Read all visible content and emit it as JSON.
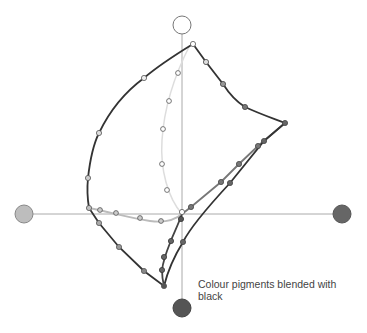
{
  "diagram": {
    "caption": "Colour pigments blended with black",
    "axes": {
      "vertical": {
        "x": 182,
        "y1": 25,
        "y2": 308
      },
      "horizontal": {
        "y": 214,
        "x1": 24,
        "x2": 342
      }
    },
    "anchors": [
      {
        "name": "top",
        "cx": 182,
        "cy": 25,
        "r": 9,
        "fill": "#ffffff"
      },
      {
        "name": "left",
        "cx": 24,
        "cy": 214,
        "r": 9,
        "fill": "#bdbdbd"
      },
      {
        "name": "right",
        "cx": 342,
        "cy": 214,
        "r": 9,
        "fill": "#666666"
      },
      {
        "name": "bottom",
        "cx": 182,
        "cy": 308,
        "r": 9,
        "fill": "#555555"
      }
    ],
    "colors": {
      "axis": "#aaaaaa",
      "outer_curve": "#333333",
      "blend_gray": "#777777",
      "inner_light": "#dddddd",
      "bottom_left_curve": "#bbbbbb",
      "caption": "#444444"
    }
  }
}
